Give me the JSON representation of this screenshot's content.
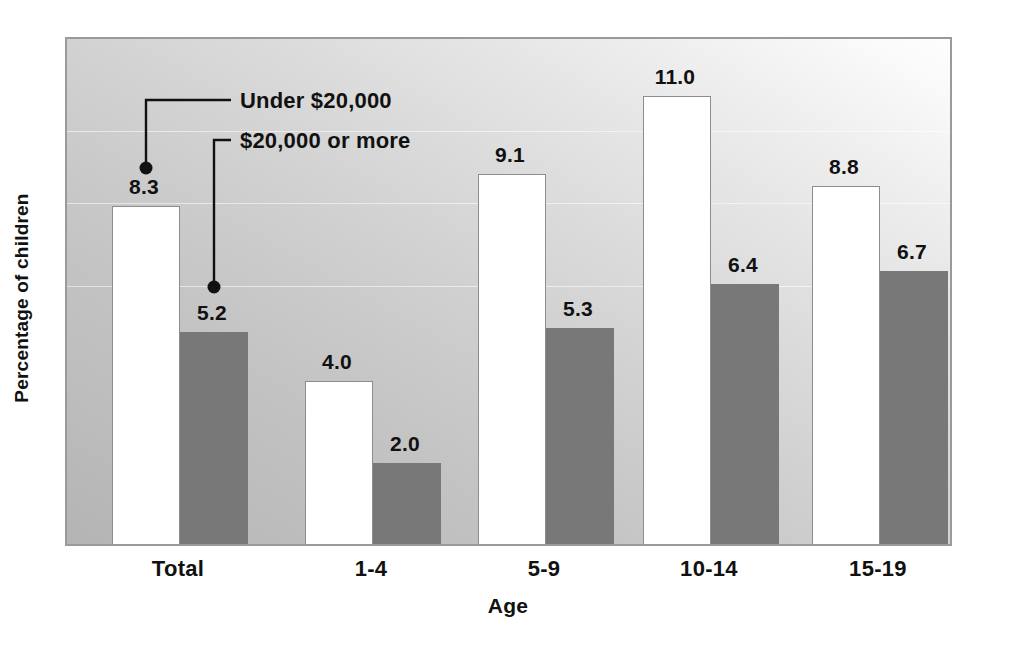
{
  "chart_data": {
    "type": "bar",
    "title": "",
    "subtitle": "",
    "xlabel": "Age",
    "ylabel": "Percentage of children",
    "categories": [
      "Total",
      "1-4",
      "5-9",
      "10-14",
      "15-19"
    ],
    "series": [
      {
        "name": "Under $20,000",
        "color": "#ffffff",
        "values": [
          8.3,
          4.0,
          9.1,
          11.0,
          8.8
        ],
        "value_labels": [
          "8.3",
          "4.0",
          "9.1",
          "11.0",
          "8.8"
        ]
      },
      {
        "name": "$20,000 or more",
        "color": "#787878",
        "values": [
          5.2,
          2.0,
          5.3,
          6.4,
          6.7
        ],
        "value_labels": [
          "5.2",
          "2.0",
          "5.3",
          "6.4",
          "6.7"
        ]
      }
    ],
    "ylim": [
      0,
      12.5
    ],
    "grid": false,
    "legend_position": "inline-annotations",
    "annotations": [
      {
        "label": "Under $20,000",
        "points_to": "Total / Under $20,000 bar"
      },
      {
        "label": "$20,000 or more",
        "points_to": "Total / $20,000 or more bar"
      }
    ],
    "axis_tick_labels": {
      "y": [],
      "x": [
        "Total",
        "1-4",
        "5-9",
        "10-14",
        "15-19"
      ]
    }
  },
  "figure": {
    "background_gradient_from": "#b4b4b4",
    "background_gradient_to": "#fdfdfd",
    "frame_color": "#9a9a9a",
    "label_color": "#111111"
  }
}
